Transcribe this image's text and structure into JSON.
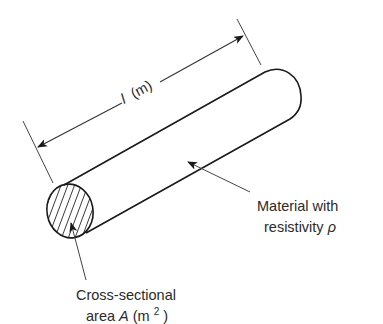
{
  "figure": {
    "type": "conductor-resistivity-diagram",
    "dimension_label": {
      "symbol": "l",
      "unit": "(m)"
    },
    "material_label": {
      "line1": "Material with",
      "line2_prefix": "resistivity ",
      "line2_symbol": "ρ"
    },
    "area_label": {
      "line1": "Cross-sectional",
      "line2_prefix": "area ",
      "line2_symbol": "A",
      "line2_unit_open": " (m",
      "line2_unit_exp": "2",
      "line2_unit_close": ")"
    },
    "colors": {
      "stroke": "#1a1a1a",
      "leader": "#444444",
      "text": "#2a2a2a",
      "background": "#ffffff"
    }
  }
}
